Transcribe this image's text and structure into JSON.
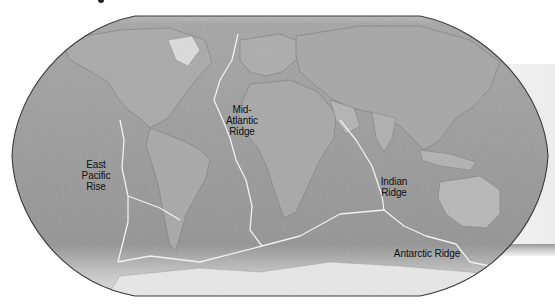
{
  "map": {
    "title_fragment": "",
    "projection": "Robinson-style world shaded relief",
    "colors": {
      "ocean": "#8c8c8c",
      "land": "#a8a8a8",
      "ice": "#e6e6e6",
      "ridge_line": "#f2f2f2",
      "outline": "#3a3a3a",
      "label": "#111111"
    },
    "labels": {
      "mid_atlantic": [
        "Mid-",
        "Atlantic",
        "Ridge"
      ],
      "east_pacific": [
        "East",
        "Pacific",
        "Rise"
      ],
      "indian": [
        "Indian",
        "Ridge"
      ],
      "antarctic": "Antarctic Ridge"
    }
  }
}
